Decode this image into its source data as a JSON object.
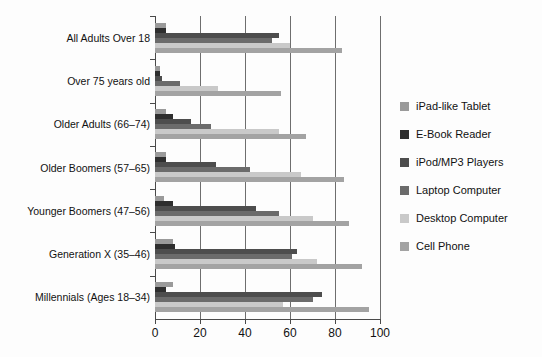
{
  "chart_data": {
    "type": "bar",
    "orientation": "horizontal",
    "title": "",
    "subtitle": "",
    "xlabel": "",
    "ylabel": "",
    "xlim": [
      0,
      100
    ],
    "xticks": [
      0,
      20,
      40,
      60,
      80,
      100
    ],
    "xtick_labels": [
      "0",
      "20",
      "40",
      "60",
      "80",
      "100"
    ],
    "grid": true,
    "grid_axis": "x",
    "legend_position": "right",
    "categories": [
      "All Adults Over 18",
      "Over 75 years old",
      "Older Adults (66–74)",
      "Older Boomers (57–65)",
      "Younger Boomers (47–56)",
      "Generation X (35–46)",
      "Millennials (Ages 18–34)"
    ],
    "series": [
      {
        "name": "iPad-like Tablet",
        "color": "#9a9a9a",
        "values": [
          5,
          2,
          5,
          5,
          4,
          8,
          8
        ]
      },
      {
        "name": "E-Book Reader",
        "color": "#2e2e2e",
        "values": [
          5,
          2,
          8,
          5,
          8,
          9,
          5
        ]
      },
      {
        "name": "iPod/MP3 Players",
        "color": "#4d4d4d",
        "values": [
          55,
          3,
          16,
          27,
          45,
          63,
          74
        ]
      },
      {
        "name": "Laptop Computer",
        "color": "#6b6b6b",
        "values": [
          52,
          11,
          25,
          42,
          55,
          61,
          70
        ]
      },
      {
        "name": "Desktop Computer",
        "color": "#c9c9c9",
        "values": [
          60,
          28,
          55,
          65,
          70,
          72,
          57
        ]
      },
      {
        "name": "Cell Phone",
        "color": "#a3a3a3",
        "values": [
          83,
          56,
          67,
          84,
          86,
          92,
          95
        ]
      }
    ]
  },
  "legend": {
    "items": [
      {
        "label": "iPad-like Tablet",
        "color": "#9a9a9a"
      },
      {
        "label": "E-Book Reader",
        "color": "#2e2e2e"
      },
      {
        "label": "iPod/MP3 Players",
        "color": "#4d4d4d"
      },
      {
        "label": "Laptop Computer",
        "color": "#6b6b6b"
      },
      {
        "label": "Desktop Computer",
        "color": "#c9c9c9"
      },
      {
        "label": "Cell Phone",
        "color": "#a3a3a3"
      }
    ]
  }
}
